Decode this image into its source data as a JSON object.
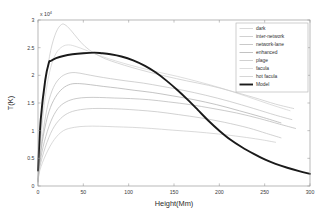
{
  "figure": {
    "title": "",
    "background_color": "#ffffff"
  },
  "axes": {
    "xlabel": "Height(Mm)",
    "ylabel": "T(K)",
    "y_exponent_prefix": "x 10",
    "y_exponent_power": "4",
    "x_ticks": [
      "0",
      "50",
      "100",
      "150",
      "200",
      "250",
      "300"
    ],
    "y_ticks": [
      "0",
      "0.5",
      "1",
      "1.5",
      "2",
      "2.5",
      "3"
    ],
    "frame_color": "#9a9a9a"
  },
  "legend": {
    "entries": [
      {
        "label": "dark",
        "color": "#c9c9c9",
        "width": 0.7
      },
      {
        "label": "inter-network",
        "color": "#bdbdbd",
        "width": 0.7
      },
      {
        "label": "network-lane",
        "color": "#b2b2b2",
        "width": 0.7
      },
      {
        "label": "enhanced",
        "color": "#a8a8a8",
        "width": 0.7
      },
      {
        "label": "plage",
        "color": "#bcbcbc",
        "width": 0.7
      },
      {
        "label": "facula",
        "color": "#cfcfcf",
        "width": 0.7
      },
      {
        "label": "hot facula",
        "color": "#c4c4c4",
        "width": 0.7
      },
      {
        "label": "Model",
        "color": "#1a1a1a",
        "width": 1.9
      }
    ]
  },
  "chart_data": {
    "type": "line",
    "title": "",
    "xlabel": "Height(Mm)",
    "ylabel": "T(K)",
    "y_scale_factor": 10000,
    "y_tick_unit": "x 10^4",
    "xlim": [
      0,
      300
    ],
    "ylim": [
      0,
      3
    ],
    "grid": false,
    "legend_position": "top-right",
    "series": [
      {
        "name": "hot facula",
        "color": "#c4c4c4",
        "x": [
          0,
          2,
          5,
          9,
          14,
          20,
          26,
          31,
          37,
          44,
          52,
          62,
          74,
          88,
          104,
          122,
          142,
          164,
          188,
          212,
          238,
          262,
          282
        ],
        "y": [
          0.12,
          0.7,
          1.35,
          1.95,
          2.45,
          2.78,
          2.92,
          2.9,
          2.8,
          2.66,
          2.52,
          2.4,
          2.3,
          2.22,
          2.14,
          2.06,
          1.98,
          1.9,
          1.82,
          1.72,
          1.6,
          1.48,
          1.4
        ]
      },
      {
        "name": "facula",
        "color": "#cfcfcf",
        "x": [
          0,
          2,
          5,
          9,
          14,
          20,
          27,
          34,
          42,
          52,
          64,
          78,
          94,
          112,
          132,
          154,
          178,
          204,
          230,
          255,
          278
        ],
        "y": [
          0.1,
          0.6,
          1.18,
          1.72,
          2.14,
          2.4,
          2.52,
          2.55,
          2.52,
          2.46,
          2.38,
          2.3,
          2.22,
          2.14,
          2.06,
          1.98,
          1.88,
          1.76,
          1.62,
          1.48,
          1.36
        ]
      },
      {
        "name": "plage",
        "color": "#bcbcbc",
        "x": [
          0,
          2,
          6,
          11,
          17,
          24,
          32,
          41,
          52,
          65,
          80,
          97,
          116,
          137,
          160,
          185,
          211,
          238,
          262,
          280
        ],
        "y": [
          0.09,
          0.52,
          1.02,
          1.48,
          1.78,
          1.95,
          2.03,
          2.05,
          2.02,
          1.98,
          1.94,
          1.9,
          1.86,
          1.8,
          1.73,
          1.64,
          1.53,
          1.4,
          1.28,
          1.2
        ]
      },
      {
        "name": "enhanced",
        "color": "#a8a8a8",
        "x": [
          0,
          2,
          6,
          12,
          19,
          27,
          36,
          46,
          58,
          72,
          88,
          106,
          126,
          148,
          172,
          197,
          222,
          246,
          268
        ],
        "y": [
          0.08,
          0.46,
          0.92,
          1.34,
          1.6,
          1.76,
          1.84,
          1.85,
          1.83,
          1.8,
          1.77,
          1.73,
          1.69,
          1.63,
          1.56,
          1.47,
          1.36,
          1.25,
          1.14
        ]
      },
      {
        "name": "network-lane",
        "color": "#b2b2b2",
        "x": [
          0,
          2,
          7,
          14,
          22,
          31,
          42,
          54,
          68,
          84,
          102,
          122,
          144,
          168,
          193,
          219,
          244,
          266,
          284
        ],
        "y": [
          0.07,
          0.4,
          0.8,
          1.16,
          1.4,
          1.52,
          1.58,
          1.6,
          1.6,
          1.59,
          1.58,
          1.56,
          1.52,
          1.47,
          1.4,
          1.32,
          1.22,
          1.12,
          1.04
        ]
      },
      {
        "name": "inter-network",
        "color": "#bdbdbd",
        "x": [
          0,
          2,
          8,
          16,
          25,
          35,
          47,
          60,
          75,
          92,
          111,
          132,
          155,
          180,
          206,
          232,
          252,
          268
        ],
        "y": [
          0.06,
          0.34,
          0.7,
          1.02,
          1.22,
          1.33,
          1.38,
          1.4,
          1.4,
          1.39,
          1.37,
          1.34,
          1.29,
          1.23,
          1.15,
          1.05,
          0.95,
          0.87
        ]
      },
      {
        "name": "dark",
        "color": "#c9c9c9",
        "x": [
          0,
          2,
          9,
          18,
          28,
          40,
          53,
          68,
          85,
          104,
          125,
          148,
          173,
          199,
          224,
          245,
          262
        ],
        "y": [
          0.05,
          0.28,
          0.58,
          0.84,
          1.0,
          1.06,
          1.08,
          1.08,
          1.07,
          1.06,
          1.04,
          1.01,
          0.98,
          0.94,
          0.89,
          0.84,
          0.79
        ]
      },
      {
        "name": "Model",
        "color": "#1a1a1a",
        "x": [
          0,
          3,
          8,
          12,
          14,
          20,
          28,
          38,
          50,
          62,
          70,
          80,
          92,
          105,
          118,
          130,
          142,
          154,
          165,
          176,
          188,
          200,
          212,
          225,
          238,
          250,
          262,
          275,
          288,
          300
        ],
        "y": [
          0.28,
          1.2,
          1.92,
          2.23,
          2.26,
          2.31,
          2.35,
          2.38,
          2.4,
          2.41,
          2.4,
          2.38,
          2.34,
          2.27,
          2.17,
          2.05,
          1.9,
          1.73,
          1.56,
          1.38,
          1.18,
          1.0,
          0.84,
          0.7,
          0.58,
          0.48,
          0.4,
          0.33,
          0.27,
          0.22
        ]
      }
    ]
  }
}
